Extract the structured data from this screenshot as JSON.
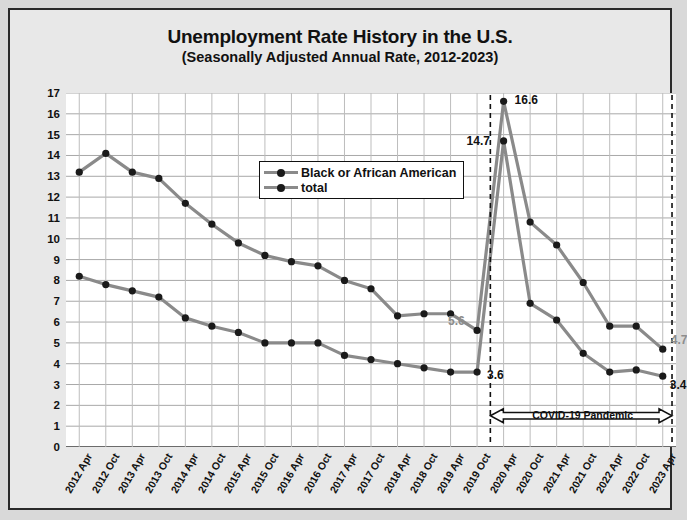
{
  "chart_data": {
    "type": "line",
    "title": "Unemployment Rate History in the U.S.",
    "subtitle": "(Seasonally Adjusted Annual Rate, 2012-2023)",
    "xlabel": "",
    "ylabel": "Percent of Labor Force",
    "ylim": [
      0,
      17
    ],
    "ytick_step": 1,
    "grid": true,
    "legend_position": "inside-top-center",
    "categories": [
      "2012 Apr",
      "2012 Oct",
      "2013 Apr",
      "2013 Oct",
      "2014 Apr",
      "2014 Oct",
      "2015 Apr",
      "2015 Oct",
      "2016 Apr",
      "2016 Oct",
      "2017 Apr",
      "2017 Oct",
      "2018 Apr",
      "2018 Oct",
      "2019 Apr",
      "2019 Oct",
      "2020 Apr",
      "2020 Oct",
      "2021 Apr",
      "2021 Oct",
      "2022 Apr",
      "2022 Oct",
      "2023 Apr"
    ],
    "yticks": [
      0,
      1,
      2,
      3,
      4,
      5,
      6,
      7,
      8,
      9,
      10,
      11,
      12,
      13,
      14,
      15,
      16,
      17
    ],
    "series": [
      {
        "name": "Black or African American",
        "color": "#8a8a8a",
        "marker_color": "#1a1a1a",
        "values": [
          13.2,
          14.1,
          13.2,
          12.9,
          11.7,
          10.7,
          9.8,
          9.2,
          8.9,
          8.7,
          8.0,
          7.6,
          6.3,
          6.4,
          6.4,
          5.6,
          16.6,
          10.8,
          9.7,
          7.9,
          5.8,
          5.8,
          4.7
        ]
      },
      {
        "name": "total",
        "color": "#8a8a8a",
        "marker_color": "#1a1a1a",
        "values": [
          8.2,
          7.8,
          7.5,
          7.2,
          6.2,
          5.8,
          5.5,
          5.0,
          5.0,
          5.0,
          4.4,
          4.2,
          4.0,
          3.8,
          3.6,
          3.6,
          14.7,
          6.9,
          6.1,
          4.5,
          3.6,
          3.7,
          3.4
        ]
      }
    ],
    "point_labels": [
      {
        "text": "16.6",
        "series": "Black or African American",
        "category": "2020 Apr",
        "value": 16.6,
        "style": "black"
      },
      {
        "text": "14.7",
        "series": "total",
        "category": "2020 Apr",
        "value": 14.7,
        "style": "black"
      },
      {
        "text": "5.6",
        "series": "Black or African American",
        "category": "2019 Oct",
        "value": 5.6,
        "style": "gray"
      },
      {
        "text": "3.6",
        "series": "total",
        "category": "2019 Oct",
        "value": 3.6,
        "style": "black"
      },
      {
        "text": "4.7",
        "series": "Black or African American",
        "category": "2023 Apr",
        "value": 4.7,
        "style": "gray"
      },
      {
        "text": "3.4",
        "series": "total",
        "category": "2023 Apr",
        "value": 3.4,
        "style": "black"
      }
    ],
    "annotations": [
      {
        "type": "span-arrow",
        "label": "COVID-19 Pandemic",
        "from_category": "2019 Oct",
        "to_category": "2023 Apr",
        "y_value": 1.5
      }
    ]
  }
}
